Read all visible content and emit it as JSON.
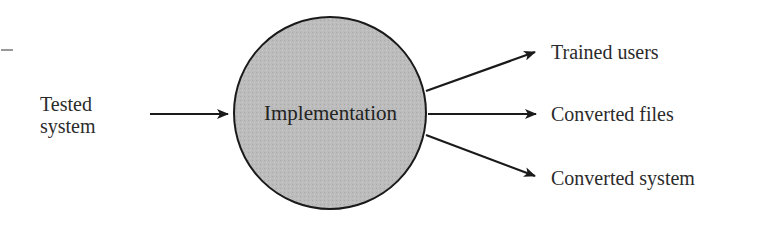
{
  "diagram": {
    "type": "process-flow",
    "process": {
      "label": "Implementation",
      "shape": "circle",
      "fill": "#b8b8b8",
      "stroke": "#1a1a1a"
    },
    "inputs": [
      {
        "label_line1": "Tested",
        "label_line2": "system"
      }
    ],
    "outputs": [
      {
        "label": "Trained users"
      },
      {
        "label": "Converted files"
      },
      {
        "label": "Converted system"
      }
    ],
    "arrow_color": "#1a1a1a"
  }
}
